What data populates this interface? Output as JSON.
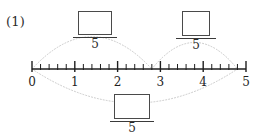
{
  "problem": {
    "number_label": "(1)"
  },
  "number_line": {
    "axis_start_value": 0,
    "axis_end_value": 5,
    "subdivisions_per_unit": 5,
    "tick_labels": [
      "0",
      "1",
      "2",
      "3",
      "4",
      "5"
    ],
    "axis_color": "#1f1f1f"
  },
  "fractions": [
    {
      "id": "top-left",
      "numerator": "",
      "numerator_placeholder": "",
      "denominator": "5"
    },
    {
      "id": "top-right",
      "numerator": "",
      "numerator_placeholder": "",
      "denominator": "5"
    },
    {
      "id": "bottom",
      "numerator": "",
      "numerator_placeholder": "",
      "denominator": "5"
    }
  ],
  "arcs": [
    {
      "id": "arc-top-left",
      "from_value": 0,
      "to_value": 2.8,
      "direction": "above",
      "style": "dotted",
      "color": "#c9c9c9"
    },
    {
      "id": "arc-top-right",
      "from_value": 2.8,
      "to_value": 4.8,
      "direction": "above",
      "style": "dotted",
      "color": "#c9c9c9"
    },
    {
      "id": "arc-bottom",
      "from_value": 0,
      "to_value": 4.8,
      "direction": "below",
      "style": "dotted",
      "color": "#c9c9c9"
    }
  ]
}
